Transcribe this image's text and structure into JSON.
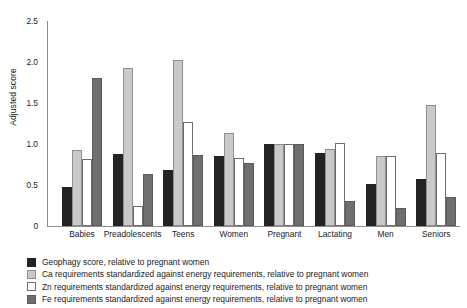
{
  "chart_data": {
    "type": "bar",
    "title": "",
    "xlabel": "",
    "ylabel": "Adjusted score",
    "ylim": [
      0,
      2.5
    ],
    "yticks": [
      "0",
      "0.5",
      "1.0",
      "1.5",
      "2.0",
      "2.5"
    ],
    "ytick_values": [
      0,
      0.5,
      1.0,
      1.5,
      2.0,
      2.5
    ],
    "grid": false,
    "legend_position": "below-left",
    "categories": [
      "Babies",
      "Preadolescents",
      "Teens",
      "Women",
      "Pregnant",
      "Lactating",
      "Men",
      "Seniors"
    ],
    "series": [
      {
        "name": "Geophagy score, relative to pregnant women",
        "key": "geophagy",
        "color": "#232323",
        "values": [
          0.48,
          0.88,
          0.68,
          0.85,
          1.0,
          0.89,
          0.51,
          0.57
        ]
      },
      {
        "name": "Ca requirements standardized against energy requirements, relative to pregnant women",
        "key": "ca",
        "color": "#c9c9c9",
        "values": [
          0.93,
          1.93,
          2.02,
          1.14,
          1.0,
          0.94,
          0.85,
          1.47
        ]
      },
      {
        "name": "Zn requirements standardized against energy requirements, relative to pregnant women",
        "key": "zn",
        "color": "#ffffff",
        "values": [
          0.82,
          0.25,
          1.27,
          0.83,
          1.0,
          1.01,
          0.85,
          0.89
        ]
      },
      {
        "name": "Fe requirements standardized against energy requirements, relative to pregnant women",
        "key": "fe",
        "color": "#6f6f6f",
        "values": [
          1.8,
          0.64,
          0.87,
          0.77,
          1.0,
          0.3,
          0.22,
          0.35
        ]
      }
    ]
  }
}
